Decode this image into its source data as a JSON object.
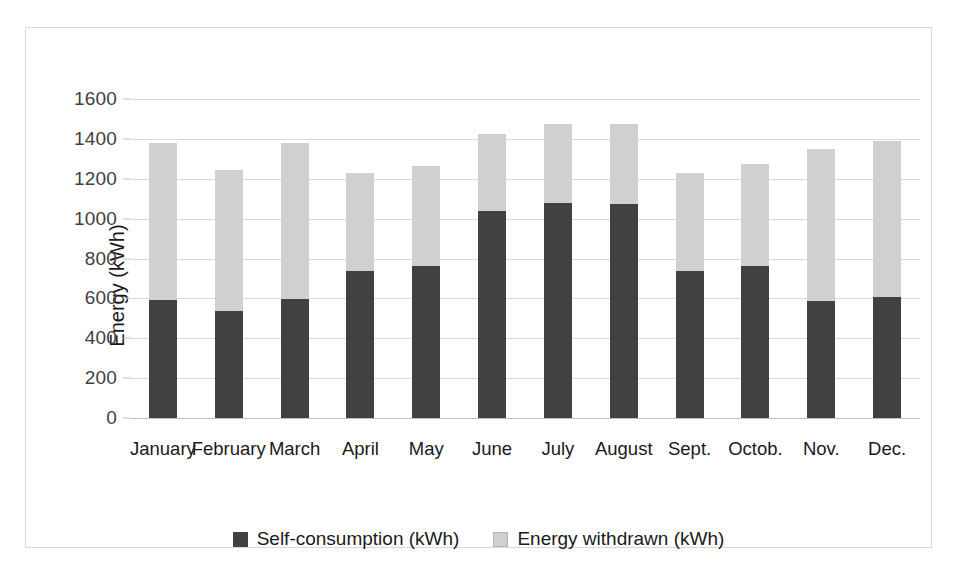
{
  "chart_data": {
    "type": "bar",
    "stacked": true,
    "title": "",
    "xlabel": "",
    "ylabel": "Energy (kWh)",
    "ylim": [
      0,
      1600
    ],
    "ytick_step": 200,
    "yticks": [
      0,
      200,
      400,
      600,
      800,
      1000,
      1200,
      1400,
      1600
    ],
    "ytick_labels": [
      "0",
      "200",
      "400",
      "600",
      "800",
      "1000",
      "1200",
      "1400",
      "1600"
    ],
    "grid": true,
    "legend_position": "bottom",
    "categories": [
      "January",
      "February",
      "March",
      "April",
      "May",
      "June",
      "July",
      "August",
      "Sept.",
      "Octob.",
      "Nov.",
      "Dec."
    ],
    "series": [
      {
        "name": "Self-consumption (kWh)",
        "color": "#414141",
        "values": [
          590,
          535,
          595,
          735,
          760,
          1040,
          1080,
          1075,
          735,
          760,
          585,
          605
        ]
      },
      {
        "name": "Energy withdrawn (kWh)",
        "color": "#d0d0d0",
        "values": [
          790,
          710,
          785,
          495,
          505,
          385,
          395,
          400,
          495,
          515,
          765,
          785
        ]
      }
    ],
    "totals": [
      1380,
      1245,
      1380,
      1230,
      1265,
      1425,
      1475,
      1475,
      1230,
      1275,
      1350,
      1390
    ]
  },
  "legend": {
    "items": [
      {
        "label": "Self-consumption (kWh)",
        "swatch": "dark"
      },
      {
        "label": "Energy withdrawn (kWh)",
        "swatch": "light"
      }
    ]
  },
  "colors": {
    "self_consumption": "#414141",
    "energy_withdrawn": "#d0d0d0",
    "gridline": "#d9d9d9",
    "border": "#d9d9d9",
    "background": "#ffffff"
  }
}
